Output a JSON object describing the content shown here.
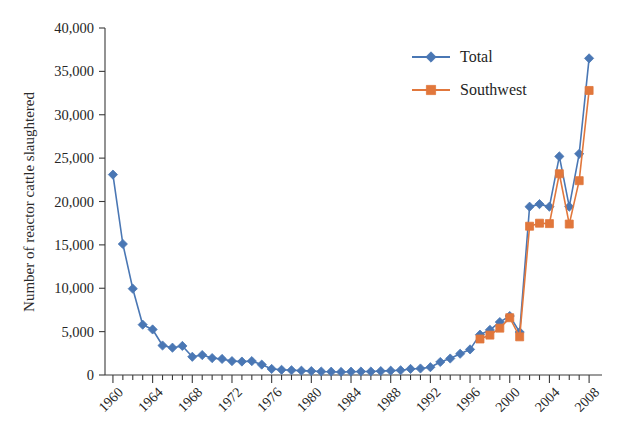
{
  "chart_data": {
    "type": "line",
    "title": "",
    "xlabel": "",
    "ylabel": "Number of reactor cattle slaughtered",
    "xlim": [
      1959.2,
      2009.3
    ],
    "ylim": [
      0,
      40000
    ],
    "ytick_labels": [
      "0",
      "5,000",
      "10,000",
      "15,000",
      "20,000",
      "25,000",
      "30,000",
      "35,000",
      "40,000"
    ],
    "ytick_values": [
      0,
      5000,
      10000,
      15000,
      20000,
      25000,
      30000,
      35000,
      40000
    ],
    "xtick_labels": [
      "1960",
      "1964",
      "1968",
      "1972",
      "1976",
      "1980",
      "1984",
      "1988",
      "1992",
      "1996",
      "2000",
      "2004",
      "2008"
    ],
    "xtick_values": [
      1960,
      1964,
      1968,
      1972,
      1976,
      1980,
      1984,
      1988,
      1992,
      1996,
      2000,
      2004,
      2008
    ],
    "xtick_rotation": 45,
    "minor_ticks_every": 1,
    "grid": false,
    "legend_position": "top-right",
    "colors": {
      "total": "#4A77B4",
      "southwest": "#E1773C",
      "axis": "#3a3a3a",
      "text": "#262626",
      "background": "#ffffff"
    },
    "x": [
      1960,
      1961,
      1962,
      1963,
      1964,
      1965,
      1966,
      1967,
      1968,
      1969,
      1970,
      1971,
      1972,
      1973,
      1974,
      1975,
      1976,
      1977,
      1978,
      1979,
      1980,
      1981,
      1982,
      1983,
      1984,
      1985,
      1986,
      1987,
      1988,
      1989,
      1990,
      1991,
      1992,
      1993,
      1994,
      1995,
      1996,
      1997,
      1998,
      1999,
      2000,
      2001,
      2002,
      2003,
      2004,
      2005,
      2006,
      2007,
      2008
    ],
    "series": [
      {
        "name": "Total",
        "marker": "diamond",
        "color": "#4A77B4",
        "values": [
          23100,
          15100,
          9950,
          5800,
          5250,
          3400,
          3150,
          3350,
          2100,
          2300,
          1950,
          1850,
          1600,
          1550,
          1600,
          1200,
          700,
          600,
          550,
          500,
          450,
          400,
          380,
          350,
          380,
          400,
          400,
          450,
          500,
          550,
          700,
          750,
          900,
          1500,
          1900,
          2450,
          2950,
          4650,
          5200,
          6100,
          6800,
          4950,
          19400,
          19700,
          19400,
          25200,
          19400,
          25500,
          36500
        ]
      },
      {
        "name": "Southwest",
        "marker": "square",
        "color": "#E1773C",
        "values": [
          null,
          null,
          null,
          null,
          null,
          null,
          null,
          null,
          null,
          null,
          null,
          null,
          null,
          null,
          null,
          null,
          null,
          null,
          null,
          null,
          null,
          null,
          null,
          null,
          null,
          null,
          null,
          null,
          null,
          null,
          null,
          null,
          null,
          null,
          null,
          null,
          null,
          4150,
          4600,
          5400,
          6600,
          4400,
          17150,
          17500,
          17450,
          23200,
          17400,
          22400,
          32800
        ]
      }
    ]
  },
  "legend": {
    "items": [
      {
        "label": "Total",
        "color": "#4A77B4",
        "marker": "diamond"
      },
      {
        "label": "Southwest",
        "color": "#E1773C",
        "marker": "square"
      }
    ]
  },
  "axes": {
    "y_title": "Number of reactor cattle slaughtered"
  }
}
